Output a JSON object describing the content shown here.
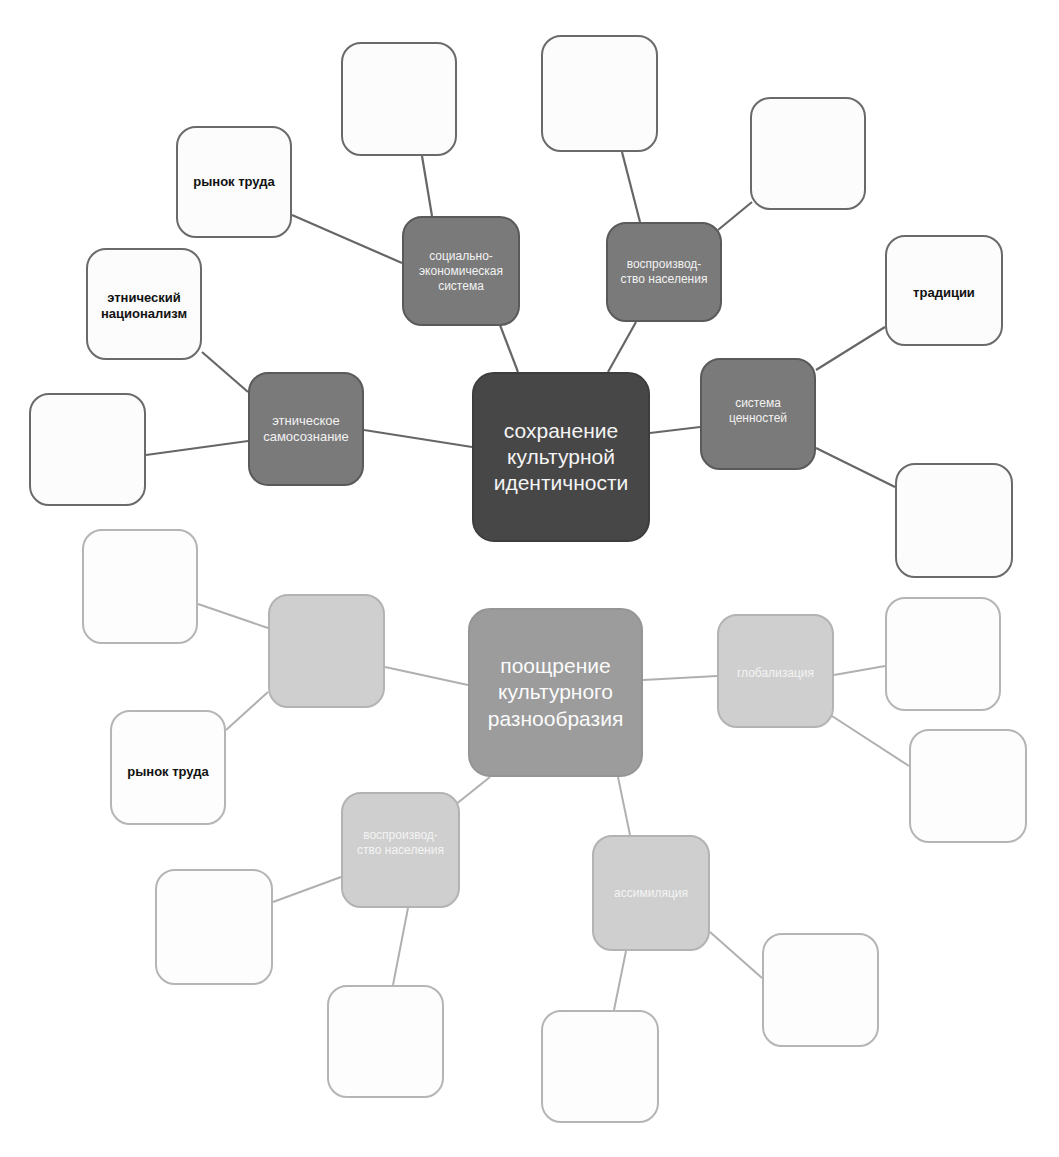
{
  "colors": {
    "top_root": "#474747",
    "top_branch": "#7a7a7a",
    "top_leaf_border": "#6a6a6a",
    "top_edge": "#666666",
    "bottom_root": "#9c9c9c",
    "bottom_branch": "#cfcfcf",
    "bottom_leaf_border": "#b5b5b5",
    "bottom_edge": "#b0b0b0"
  },
  "top_map": {
    "root": {
      "label": "сохранение\nкультурной\nидентичности"
    },
    "branches": [
      {
        "label": "этническое\nсамосознание"
      },
      {
        "label": "социально-\nэкономическая\nсистема"
      },
      {
        "label": "воспроизвод-\nство населения"
      },
      {
        "label": "система\nценностей"
      }
    ],
    "leaves": [
      {
        "label": "этнический\nнационализм"
      },
      {
        "label": ""
      },
      {
        "label": "рынок труда"
      },
      {
        "label": ""
      },
      {
        "label": ""
      },
      {
        "label": ""
      },
      {
        "label": "традиции"
      },
      {
        "label": ""
      }
    ]
  },
  "bottom_map": {
    "root": {
      "label": "поощрение\nкультурного\nразнообразия"
    },
    "branches": [
      {
        "label": ""
      },
      {
        "label": "глобализация"
      },
      {
        "label": "воспроизвод-\nство населения"
      },
      {
        "label": "ассимиляция"
      }
    ],
    "leaves": [
      {
        "label": ""
      },
      {
        "label": "рынок труда"
      },
      {
        "label": ""
      },
      {
        "label": ""
      },
      {
        "label": ""
      },
      {
        "label": ""
      },
      {
        "label": ""
      },
      {
        "label": ""
      }
    ]
  }
}
